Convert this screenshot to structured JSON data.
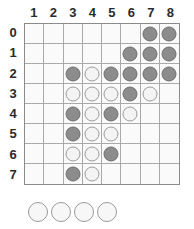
{
  "board": {
    "title": "reversi-board",
    "column_headers": [
      "1",
      "2",
      "3",
      "4",
      "5",
      "6",
      "7",
      "8"
    ],
    "row_headers": [
      "0",
      "1",
      "2",
      "3",
      "4",
      "5",
      "6",
      "7"
    ],
    "colors": {
      "black_disc": "#8c8c8c",
      "black_disc_border": "#6e6e6e",
      "white_disc": "#f4f4f4",
      "white_disc_border": "#9a9a9a",
      "grid_line": "#a9a9a9",
      "board_border": "#8b8b8b",
      "cell_background": "#fafafa",
      "label_text": "#2b2b2b"
    },
    "legend": {
      "black": "black",
      "white": "white",
      "empty": ""
    },
    "rows": [
      [
        "",
        "",
        "",
        "",
        "",
        "",
        "black",
        "black"
      ],
      [
        "",
        "",
        "",
        "",
        "",
        "black",
        "black",
        "black"
      ],
      [
        "",
        "",
        "black",
        "white",
        "black",
        "black",
        "black",
        "black"
      ],
      [
        "",
        "",
        "white",
        "white",
        "white",
        "black",
        "white",
        ""
      ],
      [
        "",
        "",
        "black",
        "white",
        "black",
        "white",
        "",
        ""
      ],
      [
        "",
        "",
        "black",
        "white",
        "white",
        "",
        "",
        ""
      ],
      [
        "",
        "",
        "white",
        "white",
        "black",
        "",
        "",
        ""
      ],
      [
        "",
        "",
        "black",
        "white",
        "",
        "",
        "",
        ""
      ]
    ]
  },
  "tray": {
    "label": "captured-discs",
    "discs": [
      "white",
      "white",
      "white",
      "white"
    ]
  }
}
